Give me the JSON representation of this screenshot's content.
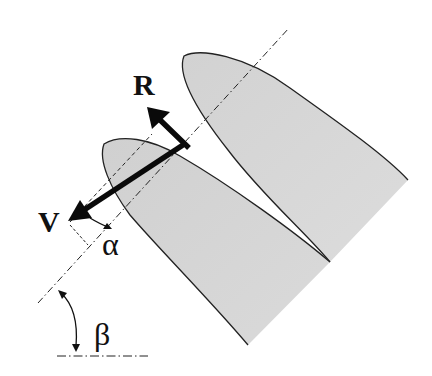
{
  "diagram": {
    "labels": {
      "resultant": "R",
      "velocity": "V",
      "angle_of_attack": "α",
      "stagger_angle": "β"
    },
    "colors": {
      "blade_fill": "#d4d4d4",
      "outline": "#222222",
      "vector": "#0a0a0a",
      "background": "#ffffff"
    },
    "elements": [
      "front-blade",
      "rear-blade",
      "chord-axis-dashdot",
      "velocity-vector",
      "resultant-vector",
      "alpha-reference-dashed",
      "beta-horizontal-reference",
      "beta-angle-arc"
    ]
  }
}
